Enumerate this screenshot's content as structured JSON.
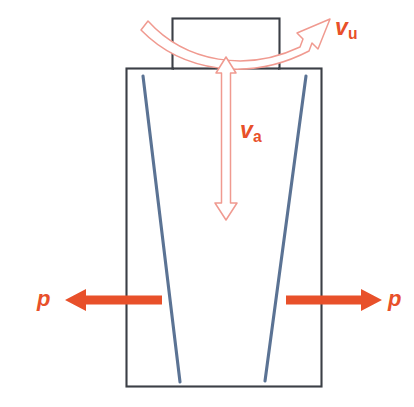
{
  "figure": {
    "type": "mechanical-schematic",
    "background_color": "#ffffff"
  },
  "colors": {
    "outline": "#3b3f46",
    "fibre": "#5b7394",
    "load_arrow": "#e8502a",
    "velocity_arrow_stroke": "#f09a90",
    "label_text": "#e8502a"
  },
  "labels": {
    "velocity_u": {
      "symbol": "v",
      "subscript": "u",
      "name": "rotational velocity"
    },
    "velocity_a": {
      "symbol": "v",
      "subscript": "a",
      "name": "axial velocity"
    },
    "pressure_left": {
      "symbol": "p",
      "subscript": "",
      "name": "load left"
    },
    "pressure_right": {
      "symbol": "p",
      "subscript": "",
      "name": "load right"
    }
  },
  "shapes": {
    "top_block": {
      "x": 172,
      "y": 18,
      "width": 108,
      "height": 50
    },
    "main_body": {
      "x": 126,
      "y": 68,
      "width": 196,
      "height": 319
    },
    "fibre_left": {
      "x1": 143,
      "y1": 76,
      "x2": 180,
      "y2": 382
    },
    "fibre_right": {
      "x1": 306,
      "y1": 76,
      "x2": 265,
      "y2": 381
    }
  },
  "arrows": {
    "curved_top": {
      "name": "rotation-arrow",
      "style": "outlined-ribbon",
      "direction": "left-to-upper-right"
    },
    "vertical_double": {
      "name": "axial-velocity-arrow",
      "style": "outlined-double-headed",
      "top_y": 57,
      "bottom_y": 220,
      "direction": "up-and-down"
    },
    "load_left": {
      "name": "load-arrow-left",
      "style": "solid",
      "direction": "left",
      "tip_x": 65,
      "tail_x": 162,
      "y": 300
    },
    "load_right": {
      "name": "load-arrow-right",
      "style": "solid",
      "direction": "right",
      "tail_x": 286,
      "tip_x": 382,
      "y": 300
    }
  }
}
